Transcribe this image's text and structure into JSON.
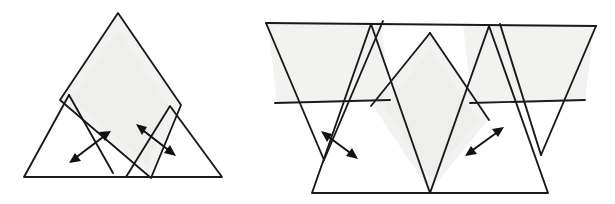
{
  "document": {
    "title": "Hand-drawn geometric dissection diagram",
    "background_color": "#ffffff",
    "ink_color": "#1a1a1a",
    "shade_color": "#f2f2f0",
    "width": 615,
    "height": 204
  },
  "figures": [
    {
      "id": "left-figure",
      "name": "triangle-pair-with-central-rhombus",
      "description": "Large equilateral triangle split into a central upright rhombus flanked by two smaller triangles that slide outward",
      "shaded_regions": [
        "central-rhombus"
      ],
      "arrows": 2,
      "bounds": {
        "x": 10,
        "y": 8,
        "width": 215,
        "height": 175
      }
    },
    {
      "id": "right-figure",
      "name": "inverted-triangle-strip-with-rhombus",
      "description": "Wide band of inverted triangles with a central shaded rhombus and two shaded parallelogram bands, pieces sliding apart",
      "shaded_regions": [
        "left-parallelogram",
        "central-rhombus",
        "right-parallelogram"
      ],
      "arrows": 2,
      "bounds": {
        "x": 258,
        "y": 18,
        "width": 350,
        "height": 180
      }
    }
  ],
  "geometry": {
    "left": {
      "rhombus": "118,13 181,105 151,178 60,100",
      "rhombus_shade": "118,15 179,105 151,175 62,100",
      "triangle_left": "69,95 24,177 156,177 110,96",
      "triangle_left_path": "M69,95 L24,177 L156,177 L112,96",
      "triangle_right": "170,106 126,177 222,177",
      "arrow_left": {
        "x1": 71,
        "y1": 162,
        "x2": 110,
        "y2": 132
      },
      "arrow_right": {
        "x1": 137,
        "y1": 125,
        "x2": 174,
        "y2": 155
      }
    },
    "right": {
      "top_edge": "266,23 596,26",
      "left_tri": "266,23 383,21 324,160",
      "mid_tri": "383,21 500,24 441,162",
      "right_tri": "500,24 596,26 541,155",
      "low_tri_left": "312,193 430,193 371,24",
      "low_tri_right": "430,193 548,193 489,26",
      "rhombus": "430,33 489,120 430,193 371,106",
      "bar_left": "275,103 390,100",
      "bar_right": "470,103 585,100",
      "arrow_left": {
        "x1": 322,
        "y1": 132,
        "x2": 356,
        "y2": 158
      },
      "arrow_right": {
        "x1": 466,
        "y1": 155,
        "x2": 503,
        "y2": 128
      }
    }
  },
  "labels": {
    "left_figure_caption": "",
    "right_figure_caption": ""
  }
}
